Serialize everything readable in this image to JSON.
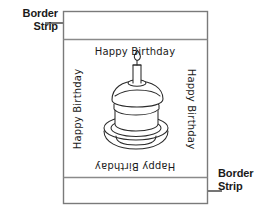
{
  "figure": {
    "background_color": "#ffffff",
    "ink_color": "#1a1a1a",
    "rule_color": "#888888"
  },
  "callouts": [
    {
      "id": "top-left",
      "line1": "Border",
      "line2": "Strip",
      "arrow_direction": "right",
      "points_to": "top-border-strip"
    },
    {
      "id": "bottom-right",
      "line1": "Border",
      "line2": "Strip",
      "arrow_direction": "left",
      "points_to": "bottom-border-strip"
    }
  ],
  "card": {
    "greetings": {
      "top": "Happy Birthday",
      "right": "Happy Birthday",
      "bottom": "Happy Birthday",
      "left": "Happy Birthday"
    },
    "illustration": {
      "name": "birthday-cake",
      "parts": [
        "plate",
        "cake-top-layer",
        "cake-bottom-layer",
        "candle",
        "flame"
      ]
    },
    "regions": {
      "top_strip_label": "Border Strip",
      "bottom_strip_label": "Border Strip"
    }
  }
}
